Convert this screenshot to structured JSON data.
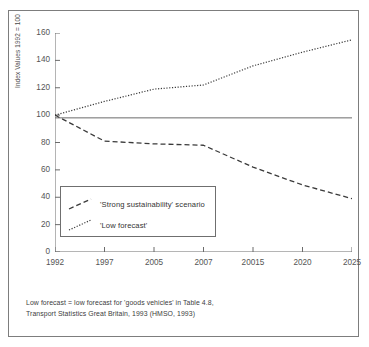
{
  "chart_data": {
    "type": "line",
    "title": "",
    "xlabel": "",
    "ylabel": "Index Values 1992 = 100",
    "categories": [
      "1992",
      "1997",
      "2005",
      "2007",
      "20015",
      "2020",
      "2025"
    ],
    "x_tick_labels": [
      "1992",
      "1997",
      "2005",
      "2007",
      "20015",
      "2020",
      "2025"
    ],
    "y_tick_labels": [
      "0",
      "20",
      "40",
      "60",
      "80",
      "100",
      "120",
      "140",
      "160"
    ],
    "y_ticks": [
      0,
      20,
      40,
      60,
      80,
      100,
      120,
      140,
      160
    ],
    "ylim": [
      0,
      160
    ],
    "grid": false,
    "legend_position": "lower-left-inside",
    "series": [
      {
        "name": "'Strong sustainability' scenario",
        "style": "dashed",
        "color": "#3a3a3a",
        "values": [
          100,
          81,
          79,
          78,
          62,
          49,
          39
        ]
      },
      {
        "name": "'Low forecast'",
        "style": "dotted",
        "color": "#3a3a3a",
        "values": [
          100,
          110,
          119,
          122,
          136,
          146,
          155
        ]
      }
    ],
    "reference_line": {
      "name": "baseline",
      "style": "solid",
      "color": "#6b6b6b",
      "value": 98
    },
    "annotations": []
  },
  "legend": {
    "items": [
      {
        "label": "'Strong sustainability' scenario",
        "style": "dashed"
      },
      {
        "label": "'Low forecast'",
        "style": "dotted"
      }
    ]
  },
  "footnote": {
    "line1": "Low forecast = low forecast for 'goods vehicles' in Table 4.8,",
    "line2": "Transport Statistics Great Britain, 1993 (HMSO, 1993)"
  },
  "colors": {
    "frame": "#7d7d7d",
    "axis": "#6b6b6b",
    "series": "#3a3a3a",
    "text": "#555555",
    "background": "#ffffff"
  }
}
